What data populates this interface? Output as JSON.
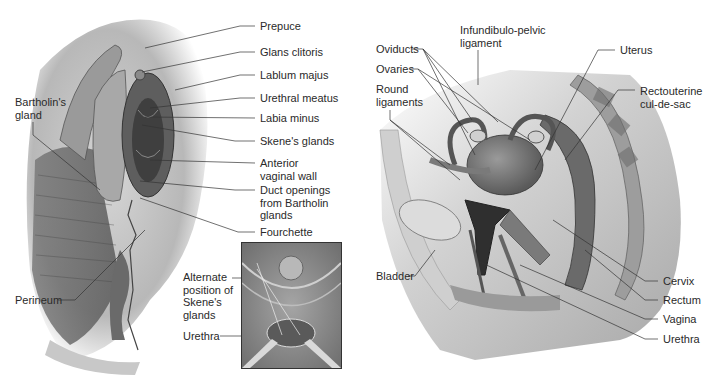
{
  "figure": {
    "type": "anatomical illustration",
    "style": "grayscale",
    "panels": [
      {
        "id": "external-view",
        "labels_right": [
          {
            "text": "Prepuce",
            "x": 260,
            "y": 20
          },
          {
            "text": "Glans clitoris",
            "x": 260,
            "y": 46
          },
          {
            "text": "Lablum majus",
            "x": 260,
            "y": 69
          },
          {
            "text": "Urethral meatus",
            "x": 260,
            "y": 92
          },
          {
            "text": "Labia minus",
            "x": 260,
            "y": 112
          },
          {
            "text": "Skene's glands",
            "x": 260,
            "y": 135
          },
          {
            "text": "Anterior\nvaginal wall",
            "x": 260,
            "y": 157
          },
          {
            "text": "Duct openings\nfrom Bartholin\nglands",
            "x": 260,
            "y": 184
          },
          {
            "text": "Fourchette",
            "x": 260,
            "y": 226
          }
        ],
        "labels_left": [
          {
            "text": "Bartholin's\ngland",
            "x": 15,
            "y": 96
          },
          {
            "text": "Perineum",
            "x": 15,
            "y": 294
          }
        ],
        "inset": {
          "labels": [
            {
              "text": "Alternate\nposition of\nSkene's\nglands",
              "x": 183,
              "y": 271
            },
            {
              "text": "Urethra",
              "x": 183,
              "y": 330
            }
          ]
        }
      },
      {
        "id": "sagittal-view",
        "labels_left": [
          {
            "text": "Oviducts",
            "x": 376,
            "y": 43
          },
          {
            "text": "Ovaries",
            "x": 376,
            "y": 63
          },
          {
            "text": "Round\nligaments",
            "x": 376,
            "y": 83
          },
          {
            "text": "Bladder",
            "x": 376,
            "y": 270
          }
        ],
        "labels_top": [
          {
            "text": "Infundibulo-pelvic\nligament",
            "x": 460,
            "y": 24
          }
        ],
        "labels_right": [
          {
            "text": "Uterus",
            "x": 620,
            "y": 44
          },
          {
            "text": "Rectouterine\ncul-de-sac",
            "x": 640,
            "y": 85
          },
          {
            "text": "Cervix",
            "x": 663,
            "y": 275
          },
          {
            "text": "Rectum",
            "x": 663,
            "y": 294
          },
          {
            "text": "Vagina",
            "x": 663,
            "y": 313
          },
          {
            "text": "Urethra",
            "x": 663,
            "y": 333
          }
        ]
      }
    ]
  }
}
